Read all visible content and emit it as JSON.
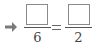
{
  "equation": {
    "arrow_icon": "right-arrow-icon",
    "left_fraction": {
      "numerator": "",
      "denominator": "6"
    },
    "operator": "=",
    "right_fraction": {
      "numerator": "",
      "denominator": "2"
    }
  },
  "colors": {
    "box_border": "#8a8a8a",
    "text": "#444444",
    "arrow": "#7a7a7a"
  }
}
